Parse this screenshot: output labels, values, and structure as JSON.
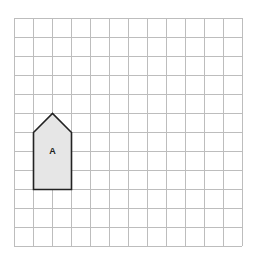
{
  "grid": {
    "columns": 12,
    "rows": 12,
    "line_color": "#bdbdbd",
    "origin_x": 14,
    "origin_y": 18,
    "cell": 19
  },
  "shape": {
    "label": "A",
    "type": "pentagon",
    "fill": "#e6e6e6",
    "stroke": "#222222",
    "vertices_grid": [
      [
        1,
        6
      ],
      [
        2,
        5
      ],
      [
        3,
        6
      ],
      [
        3,
        9
      ],
      [
        1,
        9
      ]
    ]
  }
}
